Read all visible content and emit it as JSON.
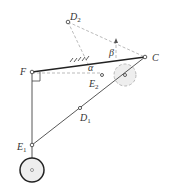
{
  "diagram": {
    "points": {
      "D2": {
        "label": "D",
        "sub": "2"
      },
      "C": {
        "label": "C"
      },
      "F": {
        "label": "F"
      },
      "E2": {
        "label": "E",
        "sub": "2"
      },
      "D1": {
        "label": "D",
        "sub": "1"
      },
      "E1": {
        "label": "E",
        "sub": "1"
      }
    },
    "angles": {
      "alpha": "α",
      "beta": "β"
    },
    "colors": {
      "link": "#222222",
      "dashed": "#aaaaaa",
      "wheel": "#eeeeee"
    }
  }
}
